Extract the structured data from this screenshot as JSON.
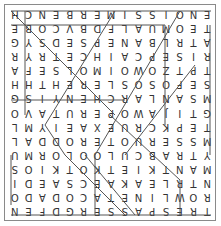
{
  "puzzle": {
    "type": "word-search",
    "orientation": "rotated-180",
    "rows": [
      "TRESPASSERGDFEN",
      "ROWLINETACODADO",
      "NTRLEAKAECSAEDI",
      "MANTKIETKOTKIOS",
      "YTRABCULOOLORMU",
      "MSSERUOTERODDAL",
      "TEPKCRUEXAEIYML",
      "GTIJAWOPERUTAVO",
      "MSANLARCHENYISG",
      "SEFOSOSLEREHTHH",
      "TPTZOWOIMOLSEFA",
      "RISEPCAIHCETRYR",
      "ATRLBANEPSEDSYG",
      "TEOMUALFDBVCOBE",
      "ENOISSIMERBENCH"
    ],
    "colors": {
      "border": "#8a8a8a",
      "text": "#333333",
      "line": "#555555"
    }
  }
}
